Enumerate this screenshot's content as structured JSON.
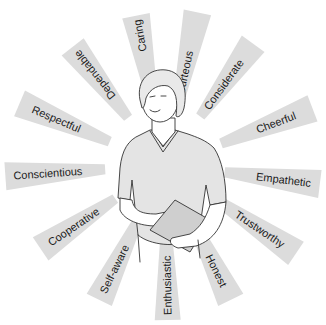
{
  "illustration": {
    "subject": "caregiver figure holding clipboard",
    "ray_color": "#dcdcdc",
    "background": "#ffffff",
    "traits": [
      {
        "label": "Caring"
      },
      {
        "label": "Courteous"
      },
      {
        "label": "Considerate"
      },
      {
        "label": "Cheerful"
      },
      {
        "label": "Empathetic"
      },
      {
        "label": "Trustworthy"
      },
      {
        "label": "Honest"
      },
      {
        "label": "Enthusiastic"
      },
      {
        "label": "Self-aware"
      },
      {
        "label": "Cooperative"
      },
      {
        "label": "Conscientious"
      },
      {
        "label": "Respectful"
      },
      {
        "label": "Dependable"
      }
    ]
  }
}
